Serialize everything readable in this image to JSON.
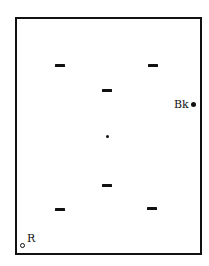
{
  "diagram": {
    "frame": {
      "stroke": "#111111",
      "background": "#ffffff"
    },
    "marks": [
      {
        "type": "dash",
        "x": 55,
        "y": 64
      },
      {
        "type": "dash",
        "x": 148,
        "y": 64
      },
      {
        "type": "dash",
        "x": 102,
        "y": 89
      },
      {
        "type": "center-dot",
        "x": 106,
        "y": 135
      },
      {
        "type": "dash",
        "x": 102,
        "y": 184
      },
      {
        "type": "dash",
        "x": 55,
        "y": 208
      },
      {
        "type": "dash",
        "x": 147,
        "y": 207
      }
    ],
    "labels": {
      "bk": "Bk",
      "r": "R"
    },
    "points": {
      "bk": {
        "style": "filled",
        "x": 191,
        "y": 102
      },
      "r": {
        "style": "open",
        "x": 20,
        "y": 243
      }
    }
  }
}
